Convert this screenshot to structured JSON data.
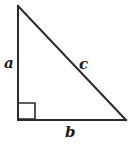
{
  "figure": {
    "name": "right-triangle-diagram",
    "background_color": "#ffffff",
    "stroke_color": "#2b2b2b",
    "label_color": "#1a1a1a",
    "stroke_width": 2,
    "right_angle_stroke_width": 1.6,
    "vertices": {
      "apex": {
        "x": 18,
        "y": 6
      },
      "bottom_left": {
        "x": 18,
        "y": 120
      },
      "bottom_right": {
        "x": 126,
        "y": 120
      }
    },
    "right_angle_marker": {
      "x": 19,
      "y": 103,
      "size": 16
    },
    "labels": {
      "vertical_leg": "a",
      "hypotenuse": "c",
      "horizontal_leg": "b"
    }
  }
}
